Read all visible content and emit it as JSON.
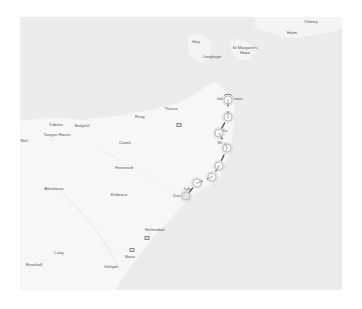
{
  "map": {
    "colors": {
      "sea": "#ececec",
      "land": "#f7f7f7",
      "route": "#555555",
      "marker_ring": "#bdbdbd",
      "label": "#555555"
    },
    "places": [
      {
        "name": "Orkney",
        "x": 311,
        "y": 22
      },
      {
        "name": "Holm",
        "x": 292,
        "y": 33
      },
      {
        "name": "Hoy",
        "x": 196,
        "y": 42
      },
      {
        "name": "St Margaret's",
        "x": 245,
        "y": 48
      },
      {
        "name": "Hope",
        "x": 245,
        "y": 53
      },
      {
        "name": "Longhope",
        "x": 212,
        "y": 57
      },
      {
        "name": "John o' Groats-left",
        "display": "Joh",
        "x": 220,
        "y": 99
      },
      {
        "name": "John o' Groats-right",
        "display": "roats",
        "x": 238,
        "y": 99
      },
      {
        "name": "Thurso",
        "x": 171,
        "y": 109
      },
      {
        "name": "Reay",
        "x": 140,
        "y": 117
      },
      {
        "name": "Tubrine",
        "x": 56,
        "y": 125
      },
      {
        "name": "Bettyhill",
        "x": 82,
        "y": 126
      },
      {
        "name": "Tongue House",
        "x": 57,
        "y": 135
      },
      {
        "name": "Neil",
        "x": 24,
        "y": 141
      },
      {
        "name": "Coock",
        "x": 125,
        "y": 143
      },
      {
        "name": "Forsinard",
        "x": 124,
        "y": 168
      },
      {
        "name": "Altnaharra",
        "x": 54,
        "y": 189
      },
      {
        "name": "Kinbrace",
        "x": 119,
        "y": 195
      },
      {
        "name": "Lybster",
        "display": "Lyb",
        "x": 187,
        "y": 189
      },
      {
        "name": "Dunbeath",
        "display": "Dun",
        "x": 177,
        "y": 196
      },
      {
        "name": "Helmsdale",
        "x": 155,
        "y": 230
      },
      {
        "name": "Lairg",
        "x": 59,
        "y": 253
      },
      {
        "name": "Brora",
        "x": 130,
        "y": 257
      },
      {
        "name": "Rosehall",
        "x": 34,
        "y": 265
      },
      {
        "name": "Golspie",
        "x": 111,
        "y": 267
      },
      {
        "name": "Wick",
        "display": "Wi",
        "x": 220,
        "y": 143
      },
      {
        "name": "Keiss",
        "display": "Ke",
        "x": 225,
        "y": 131
      }
    ],
    "pois": [
      {
        "name": "poi-thurso",
        "x": 179,
        "y": 125
      },
      {
        "name": "poi-helmsdale",
        "x": 147,
        "y": 238
      },
      {
        "name": "poi-brora",
        "x": 132,
        "y": 250
      }
    ],
    "route_markers": [
      {
        "id": "start",
        "x": 228,
        "y": 100
      },
      {
        "id": "stop-2",
        "x": 228,
        "y": 117
      },
      {
        "id": "stop-3",
        "x": 219,
        "y": 133
      },
      {
        "id": "stop-4",
        "x": 227,
        "y": 148
      },
      {
        "id": "stop-5",
        "x": 219,
        "y": 166
      },
      {
        "id": "stop-6",
        "x": 212,
        "y": 177
      },
      {
        "id": "stop-7",
        "x": 197,
        "y": 183
      },
      {
        "id": "stop-8",
        "x": 186,
        "y": 196
      }
    ],
    "route_path": "M228,100 L228,117 L219,133 L227,148 L219,166 L212,177 L197,183 L186,196"
  }
}
